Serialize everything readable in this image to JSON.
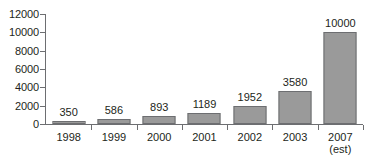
{
  "chart_data": {
    "type": "bar",
    "title": "",
    "subtitle": "",
    "xlabel": "",
    "ylabel": "",
    "categories": [
      "1998",
      "1999",
      "2000",
      "2001",
      "2002",
      "2003",
      "2007"
    ],
    "category_sublabels": [
      "",
      "",
      "",
      "",
      "",
      "",
      "(est)"
    ],
    "values": [
      350,
      586,
      893,
      1189,
      1952,
      3580,
      10000
    ],
    "value_labels": [
      "350",
      "586",
      "893",
      "1189",
      "1952",
      "3580",
      "10000"
    ],
    "ylim": [
      0,
      12000
    ],
    "yticks": [
      0,
      2000,
      4000,
      6000,
      8000,
      10000,
      12000
    ],
    "ytick_labels": [
      "0",
      "2000",
      "4000",
      "6000",
      "8000",
      "10000",
      "12000"
    ],
    "grid": false,
    "legend": false,
    "legend_position": "none",
    "bar_fill_color": "#9a9a9a",
    "bar_border_color": "#6d6e71",
    "axis_color": "#6d6e71",
    "text_color": "#231f20",
    "background_color": "#ffffff"
  }
}
